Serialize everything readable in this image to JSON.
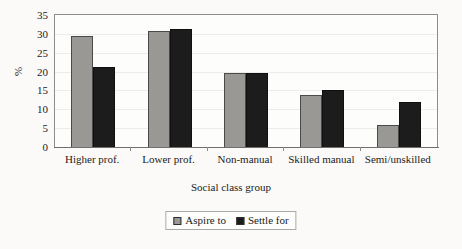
{
  "chart_data": {
    "type": "bar",
    "title": "",
    "xlabel": "Social class group",
    "ylabel": "%",
    "ylim": [
      0,
      35
    ],
    "ytick_step": 5,
    "yticks": [
      "0",
      "5",
      "10",
      "15",
      "20",
      "25",
      "30",
      "35"
    ],
    "grid": true,
    "legend_position": "bottom",
    "categories": [
      "Higher prof.",
      "Lower prof.",
      "Non-manual",
      "Skilled manual",
      "Semi/unskilled"
    ],
    "series": [
      {
        "name": "Aspire to",
        "color": "#999894",
        "values": [
          29.5,
          30.8,
          19.7,
          13.9,
          5.8
        ]
      },
      {
        "name": "Settle for",
        "color": "#1c1c1c",
        "values": [
          21.2,
          31.3,
          19.7,
          15.0,
          12.0
        ]
      }
    ]
  },
  "legend": {
    "entries": [
      {
        "label": "Aspire to"
      },
      {
        "label": "Settle for"
      }
    ]
  },
  "colors": {
    "aspire": "#999894",
    "settle": "#1c1c1c",
    "frame": "#8d8d8d",
    "background": "#fbfaf8"
  }
}
